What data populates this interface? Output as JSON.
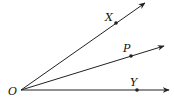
{
  "diagram": {
    "type": "angle-rays",
    "vertex": {
      "label": "O",
      "x": 21,
      "y": 90
    },
    "rays": [
      {
        "name": "ray-OX",
        "end": {
          "x": 145,
          "y": 3
        },
        "point": {
          "label": "X",
          "x": 116,
          "y": 23,
          "lx": 105,
          "ly": 21
        }
      },
      {
        "name": "ray-OP",
        "end": {
          "x": 164,
          "y": 46
        },
        "point": {
          "label": "P",
          "x": 131,
          "y": 56,
          "lx": 123,
          "ly": 52
        }
      },
      {
        "name": "ray-OY",
        "end": {
          "x": 169,
          "y": 90
        },
        "point": {
          "label": "Y",
          "x": 137,
          "y": 90,
          "lx": 130,
          "ly": 86
        }
      }
    ],
    "colors": {
      "stroke": "#222222",
      "text": "#111111"
    }
  }
}
